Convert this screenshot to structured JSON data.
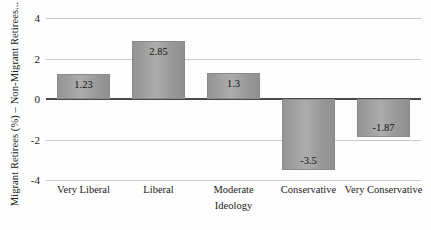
{
  "chart_data": {
    "type": "bar",
    "title": "",
    "categories": [
      "Very Liberal",
      "Liberal",
      "Moderate",
      "Conservative",
      "Very Conservative"
    ],
    "values": [
      1.23,
      2.85,
      1.3,
      -3.5,
      -1.87
    ],
    "value_labels": [
      "1.23",
      "2.85",
      "1.3",
      "-3.5",
      "-1.87"
    ],
    "xlabel": "Ideology",
    "ylabel": "Migrant Retirees (%) – Non-Migrant Retirees...",
    "ylim": [
      -4,
      4
    ],
    "yticks": [
      4,
      2,
      0,
      -2,
      -4
    ],
    "ytick_labels": [
      "4",
      "2",
      "0",
      "-2",
      "-4"
    ],
    "grid": true,
    "legend": "none",
    "bar_color": "#9a9a9a",
    "gridline_color": "#c9c9c9",
    "zeroline_color": "#4a4a4a"
  }
}
